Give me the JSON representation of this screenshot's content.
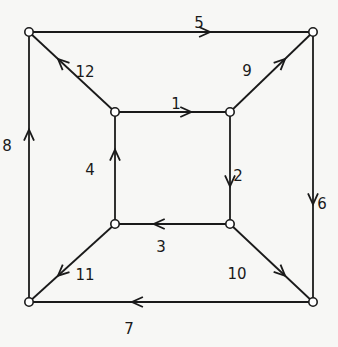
{
  "diagram": {
    "type": "directed-graph",
    "colors": {
      "stroke": "#1a1a1a",
      "background": "#f7f7f5",
      "node_fill": "#ffffff"
    },
    "nodes": [
      {
        "id": "outer-top-left",
        "x": 29,
        "y": 32
      },
      {
        "id": "outer-top-right",
        "x": 313,
        "y": 32
      },
      {
        "id": "outer-bottom-left",
        "x": 29,
        "y": 302
      },
      {
        "id": "outer-bottom-right",
        "x": 313,
        "y": 302
      },
      {
        "id": "inner-top-left",
        "x": 115,
        "y": 112
      },
      {
        "id": "inner-top-right",
        "x": 230,
        "y": 112
      },
      {
        "id": "inner-bottom-left",
        "x": 115,
        "y": 224
      },
      {
        "id": "inner-bottom-right",
        "x": 230,
        "y": 224
      }
    ],
    "edges": [
      {
        "label": "1",
        "from": "inner-top-left",
        "to": "inner-top-right",
        "label_x": 176,
        "label_y": 104
      },
      {
        "label": "2",
        "from": "inner-top-right",
        "to": "inner-bottom-right",
        "label_x": 238,
        "label_y": 176
      },
      {
        "label": "3",
        "from": "inner-bottom-right",
        "to": "inner-bottom-left",
        "label_x": 161,
        "label_y": 247
      },
      {
        "label": "4",
        "from": "inner-bottom-left",
        "to": "inner-top-left",
        "label_x": 90,
        "label_y": 170
      },
      {
        "label": "5",
        "from": "outer-top-left",
        "to": "outer-top-right",
        "label_x": 199,
        "label_y": 23
      },
      {
        "label": "6",
        "from": "outer-top-right",
        "to": "outer-bottom-right",
        "label_x": 322,
        "label_y": 204
      },
      {
        "label": "7",
        "from": "outer-bottom-right",
        "to": "outer-bottom-left",
        "label_x": 129,
        "label_y": 329
      },
      {
        "label": "8",
        "from": "outer-bottom-left",
        "to": "outer-top-left",
        "label_x": 7,
        "label_y": 146
      },
      {
        "label": "9",
        "from": "inner-top-right",
        "to": "outer-top-right",
        "label_x": 247,
        "label_y": 71
      },
      {
        "label": "10",
        "from": "inner-bottom-right",
        "to": "outer-bottom-right",
        "label_x": 237,
        "label_y": 274
      },
      {
        "label": "11",
        "from": "inner-bottom-left",
        "to": "outer-bottom-left",
        "label_x": 85,
        "label_y": 275
      },
      {
        "label": "12",
        "from": "inner-top-left",
        "to": "outer-top-left",
        "label_x": 85,
        "label_y": 72
      }
    ]
  }
}
